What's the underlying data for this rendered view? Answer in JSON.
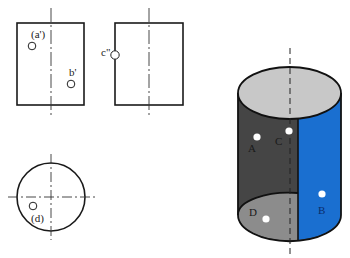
{
  "figure": {
    "front_view": {
      "points": [
        {
          "label": "(a')",
          "name": "point-a-prime"
        },
        {
          "label": "b'",
          "name": "point-b-prime"
        }
      ]
    },
    "side_view": {
      "points": [
        {
          "label": "c\"",
          "name": "point-c-double-prime"
        }
      ]
    },
    "top_view": {
      "points": [
        {
          "label": "(d)",
          "name": "point-d"
        }
      ]
    },
    "cylinder_3d": {
      "colors": {
        "top_face": "#c8c8c8",
        "dark_wall": "#454545",
        "blue_wall": "#1a6fd0",
        "bottom_inner": "#8c8c8c",
        "outline": "#111111"
      },
      "points": [
        {
          "label": "A",
          "name": "point-A"
        },
        {
          "label": "B",
          "name": "point-B"
        },
        {
          "label": "C",
          "name": "point-C"
        },
        {
          "label": "D",
          "name": "point-D"
        }
      ]
    }
  }
}
